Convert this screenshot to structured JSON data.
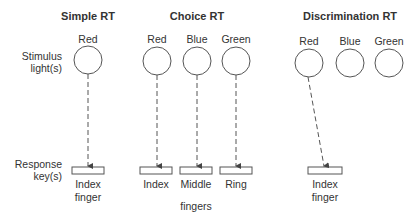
{
  "row_labels": {
    "stimulus": [
      "Stimulus",
      "light(s)"
    ],
    "response": [
      "Response",
      "key(s)"
    ]
  },
  "panels": [
    {
      "title": "Simple RT",
      "stimuli": [
        "Red"
      ],
      "responses": [
        "Index finger"
      ],
      "mapping": [
        [
          "Red",
          "Index finger"
        ]
      ]
    },
    {
      "title": "Choice RT",
      "stimuli": [
        "Red",
        "Blue",
        "Green"
      ],
      "responses": [
        "Index",
        "Middle",
        "Ring"
      ],
      "response_group_label": "fingers",
      "mapping": [
        [
          "Red",
          "Index"
        ],
        [
          "Blue",
          "Middle"
        ],
        [
          "Green",
          "Ring"
        ]
      ]
    },
    {
      "title": "Discrimination RT",
      "stimuli": [
        "Red",
        "Blue",
        "Green"
      ],
      "responses": [
        "Index finger"
      ],
      "mapping": [
        [
          "Red",
          "Index finger"
        ]
      ]
    }
  ],
  "labels": {
    "simple_title": "Simple RT",
    "choice_title": "Choice RT",
    "disc_title": "Discrimination RT",
    "stim_1": "Stimulus",
    "stim_2": "light(s)",
    "resp_1": "Response",
    "resp_2": "key(s)",
    "red": "Red",
    "blue": "Blue",
    "green": "Green",
    "index": "Index",
    "finger": "finger",
    "middle": "Middle",
    "ring": "Ring",
    "fingers": "fingers"
  },
  "colors": {
    "stroke": "#555555",
    "text": "#333333"
  }
}
